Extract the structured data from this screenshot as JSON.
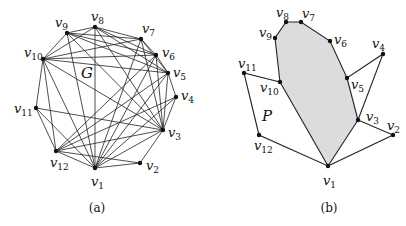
{
  "figure": {
    "panel_a": {
      "caption": "(a)",
      "graph_label": "G",
      "vertices": [
        {
          "id": "v1",
          "label": "v",
          "sub": "1",
          "x": 95,
          "y": 168,
          "lx": 91,
          "ly": 186
        },
        {
          "id": "v2",
          "label": "v",
          "sub": "2",
          "x": 140,
          "y": 163,
          "lx": 146,
          "ly": 170
        },
        {
          "id": "v3",
          "label": "v",
          "sub": "3",
          "x": 163,
          "y": 130,
          "lx": 168,
          "ly": 137
        },
        {
          "id": "v4",
          "label": "v",
          "sub": "4",
          "x": 176,
          "y": 97,
          "lx": 181,
          "ly": 100
        },
        {
          "id": "v5",
          "label": "v",
          "sub": "5",
          "x": 168,
          "y": 73,
          "lx": 173,
          "ly": 77
        },
        {
          "id": "v6",
          "label": "v",
          "sub": "6",
          "x": 156,
          "y": 55,
          "lx": 162,
          "ly": 57
        },
        {
          "id": "v7",
          "label": "v",
          "sub": "7",
          "x": 141,
          "y": 39,
          "lx": 142,
          "ly": 33
        },
        {
          "id": "v8",
          "label": "v",
          "sub": "8",
          "x": 95,
          "y": 27,
          "lx": 91,
          "ly": 21
        },
        {
          "id": "v9",
          "label": "v",
          "sub": "9",
          "x": 67,
          "y": 33,
          "lx": 55,
          "ly": 27
        },
        {
          "id": "v10",
          "label": "v",
          "sub": "10",
          "x": 43,
          "y": 59,
          "lx": 24,
          "ly": 57
        },
        {
          "id": "v11",
          "label": "v",
          "sub": "11",
          "x": 36,
          "y": 108,
          "lx": 14,
          "ly": 113
        },
        {
          "id": "v12",
          "label": "v",
          "sub": "12",
          "x": 56,
          "y": 151,
          "lx": 50,
          "ly": 167
        }
      ],
      "edges": [
        [
          "v1",
          "v2"
        ],
        [
          "v2",
          "v3"
        ],
        [
          "v3",
          "v4"
        ],
        [
          "v4",
          "v5"
        ],
        [
          "v5",
          "v6"
        ],
        [
          "v6",
          "v7"
        ],
        [
          "v7",
          "v8"
        ],
        [
          "v8",
          "v9"
        ],
        [
          "v9",
          "v10"
        ],
        [
          "v10",
          "v11"
        ],
        [
          "v11",
          "v12"
        ],
        [
          "v12",
          "v1"
        ],
        [
          "v1",
          "v3"
        ],
        [
          "v1",
          "v5"
        ],
        [
          "v1",
          "v6"
        ],
        [
          "v1",
          "v7"
        ],
        [
          "v1",
          "v8"
        ],
        [
          "v1",
          "v9"
        ],
        [
          "v1",
          "v10"
        ],
        [
          "v1",
          "v11"
        ],
        [
          "v3",
          "v5"
        ],
        [
          "v3",
          "v6"
        ],
        [
          "v3",
          "v7"
        ],
        [
          "v3",
          "v8"
        ],
        [
          "v3",
          "v9"
        ],
        [
          "v3",
          "v10"
        ],
        [
          "v3",
          "v11"
        ],
        [
          "v3",
          "v12"
        ],
        [
          "v5",
          "v7"
        ],
        [
          "v5",
          "v8"
        ],
        [
          "v5",
          "v9"
        ],
        [
          "v5",
          "v10"
        ],
        [
          "v5",
          "v12"
        ],
        [
          "v6",
          "v8"
        ],
        [
          "v6",
          "v9"
        ],
        [
          "v6",
          "v10"
        ],
        [
          "v6",
          "v12"
        ],
        [
          "v7",
          "v9"
        ],
        [
          "v7",
          "v10"
        ],
        [
          "v8",
          "v10"
        ],
        [
          "v10",
          "v12"
        ],
        [
          "v12",
          "v2"
        ],
        [
          "v12",
          "v4"
        ],
        [
          "v1",
          "v4"
        ]
      ]
    },
    "panel_b": {
      "caption": "(b)",
      "polygon_label": "P",
      "vertices": [
        {
          "id": "v1",
          "label": "v",
          "sub": "1",
          "x": 328,
          "y": 166,
          "lx": 323,
          "ly": 185
        },
        {
          "id": "v2",
          "label": "v",
          "sub": "2",
          "x": 393,
          "y": 135,
          "lx": 387,
          "ly": 130
        },
        {
          "id": "v3",
          "label": "v",
          "sub": "3",
          "x": 358,
          "y": 120,
          "lx": 366,
          "ly": 121
        },
        {
          "id": "v4",
          "label": "v",
          "sub": "4",
          "x": 383,
          "y": 54,
          "lx": 372,
          "ly": 48
        },
        {
          "id": "v5",
          "label": "v",
          "sub": "5",
          "x": 347,
          "y": 78,
          "lx": 351,
          "ly": 89
        },
        {
          "id": "v6",
          "label": "v",
          "sub": "6",
          "x": 330,
          "y": 41,
          "lx": 334,
          "ly": 44
        },
        {
          "id": "v7",
          "label": "v",
          "sub": "7",
          "x": 301,
          "y": 22,
          "lx": 302,
          "ly": 18
        },
        {
          "id": "v8",
          "label": "v",
          "sub": "8",
          "x": 286,
          "y": 22,
          "lx": 276,
          "ly": 17
        },
        {
          "id": "v9",
          "label": "v",
          "sub": "9",
          "x": 275,
          "y": 38,
          "lx": 259,
          "ly": 37
        },
        {
          "id": "v10",
          "label": "v",
          "sub": "10",
          "x": 280,
          "y": 82,
          "lx": 260,
          "ly": 92
        },
        {
          "id": "v11",
          "label": "v",
          "sub": "11",
          "x": 244,
          "y": 73,
          "lx": 238,
          "ly": 68
        },
        {
          "id": "v12",
          "label": "v",
          "sub": "12",
          "x": 259,
          "y": 135,
          "lx": 254,
          "ly": 150
        }
      ],
      "boundary_order": [
        "v1",
        "v2",
        "v3",
        "v4",
        "v5",
        "v6",
        "v7",
        "v8",
        "v9",
        "v10",
        "v11",
        "v12"
      ],
      "shaded_region": [
        "v1",
        "v3",
        "v5",
        "v6",
        "v7",
        "v8",
        "v9",
        "v10"
      ],
      "shade_color": "#dcdcdc",
      "p_label_pos": {
        "x": 262,
        "y": 121
      }
    },
    "g_label_pos": {
      "x": 81,
      "y": 78
    },
    "caption_a_pos": {
      "x": 97,
      "y": 212
    },
    "caption_b_pos": {
      "x": 329,
      "y": 212
    }
  }
}
